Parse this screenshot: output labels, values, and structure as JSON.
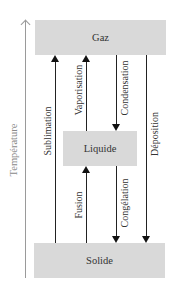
{
  "diagram": {
    "axis": {
      "label": "Température",
      "color": "#8a8a8a",
      "direction": "up"
    },
    "states": {
      "gas": "Gaz",
      "liquid": "Liquide",
      "solid": "Solide"
    },
    "transitions": {
      "sublimation": {
        "label": "Sublimation",
        "from": "Solide",
        "to": "Gaz",
        "direction": "up"
      },
      "vaporisation": {
        "label": "Vaporisation",
        "from": "Liquide",
        "to": "Gaz",
        "direction": "up"
      },
      "condensation": {
        "label": "Condensation",
        "from": "Gaz",
        "to": "Liquide",
        "direction": "down"
      },
      "deposition": {
        "label": "Déposition",
        "from": "Gaz",
        "to": "Solide",
        "direction": "down"
      },
      "fusion": {
        "label": "Fusion",
        "from": "Solide",
        "to": "Liquide",
        "direction": "up"
      },
      "congelation": {
        "label": "Congélation",
        "from": "Liquide",
        "to": "Solide",
        "direction": "down"
      }
    },
    "colors": {
      "box_fill": "#d9d9d9",
      "arrow": "#111111",
      "axis": "#9a9a9a"
    }
  }
}
